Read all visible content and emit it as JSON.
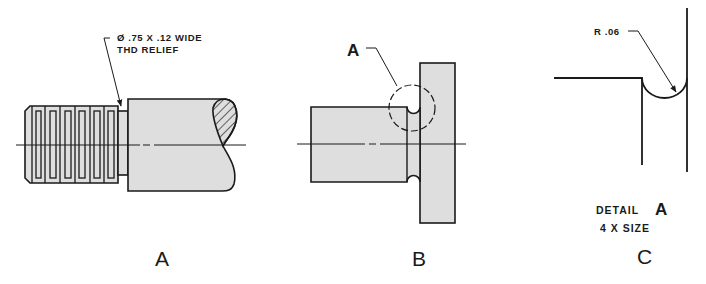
{
  "figure": {
    "colors": {
      "part_fill": "#dedede",
      "line": "#1a1a1a",
      "background": "#ffffff"
    },
    "views": [
      {
        "id": "A",
        "label": "A",
        "note_line1": "Ø .75  X .12 WIDE",
        "note_line2": "THD RELIEF",
        "description": "threaded shaft with thread relief groove"
      },
      {
        "id": "B",
        "label": "B",
        "callout": "A",
        "description": "shaft with flange and fillet relief, detail circle A"
      },
      {
        "id": "C",
        "label": "C",
        "radius_note": "R .06",
        "detail_title": "DETAIL",
        "detail_letter": "A",
        "detail_scale": "4 X SIZE",
        "description": "enlarged detail of relief groove"
      }
    ]
  }
}
